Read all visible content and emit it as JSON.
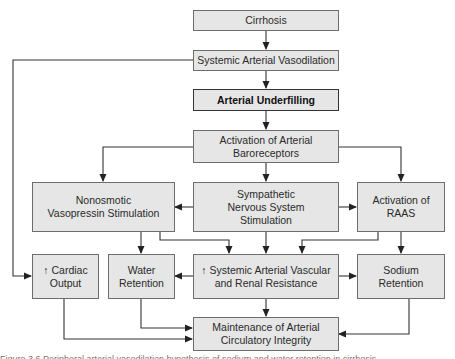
{
  "diagram": {
    "type": "flowchart",
    "nodes": [
      {
        "id": "cirrhosis",
        "label": "Cirrhosis"
      },
      {
        "id": "vasodilation",
        "label": "Systemic Arterial Vasodilation"
      },
      {
        "id": "underfilling",
        "label": "Arterial Underfilling",
        "emphasis": "bold"
      },
      {
        "id": "baroreceptors",
        "label": "Activation of Arterial\nBaroreceptors"
      },
      {
        "id": "vasopressin",
        "label": "Nonosmotic\nVasopressin Stimulation"
      },
      {
        "id": "sympathetic",
        "label": "Sympathetic\nNervous System\nStimulation"
      },
      {
        "id": "raas",
        "label": "Activation of\nRAAS"
      },
      {
        "id": "cardiac",
        "label": "↑ Cardiac\nOutput"
      },
      {
        "id": "water",
        "label": "Water\nRetention"
      },
      {
        "id": "resistance",
        "label": "↑ Systemic Arterial Vascular\nand Renal Resistance"
      },
      {
        "id": "sodium",
        "label": "Sodium\nRetention"
      },
      {
        "id": "integrity",
        "label": "Maintenance of Arterial\nCirculatory Integrity"
      }
    ],
    "edges": [
      {
        "from": "cirrhosis",
        "to": "vasodilation"
      },
      {
        "from": "vasodilation",
        "to": "underfilling"
      },
      {
        "from": "vasodilation",
        "to": "cardiac"
      },
      {
        "from": "underfilling",
        "to": "baroreceptors"
      },
      {
        "from": "baroreceptors",
        "to": "vasopressin"
      },
      {
        "from": "baroreceptors",
        "to": "sympathetic"
      },
      {
        "from": "baroreceptors",
        "to": "raas"
      },
      {
        "from": "sympathetic",
        "to": "vasopressin"
      },
      {
        "from": "sympathetic",
        "to": "raas"
      },
      {
        "from": "vasopressin",
        "to": "water"
      },
      {
        "from": "vasopressin",
        "to": "resistance"
      },
      {
        "from": "sympathetic",
        "to": "resistance"
      },
      {
        "from": "raas",
        "to": "resistance"
      },
      {
        "from": "raas",
        "to": "sodium"
      },
      {
        "from": "resistance",
        "to": "water"
      },
      {
        "from": "resistance",
        "to": "sodium"
      },
      {
        "from": "resistance",
        "to": "integrity"
      },
      {
        "from": "water",
        "to": "integrity"
      },
      {
        "from": "cardiac",
        "to": "integrity"
      },
      {
        "from": "sodium",
        "to": "integrity"
      }
    ]
  },
  "caption": "Figure 3.6  Peripheral arterial vasodilation hypothesis of sodium and water retention in cirrhosis"
}
